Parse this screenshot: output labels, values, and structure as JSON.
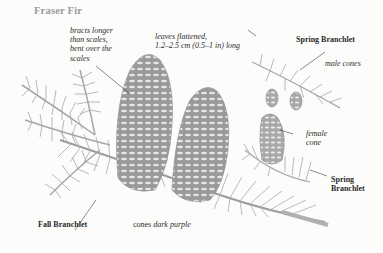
{
  "title": "Fraser Fir",
  "labels": {
    "bracts": [
      "bracts longer",
      "than scales,",
      "bent over the",
      "scales"
    ],
    "leaves": [
      "leaves flattened,",
      "1.2–2.5 cm (0.5–1 in) long"
    ],
    "spring_branchlet_top": "Spring Branchlet",
    "male_cones": "male cones",
    "female_cone": [
      "female",
      "cone"
    ],
    "spring_branchlet_bottom": [
      "Spring",
      "Branchlet"
    ],
    "fall_branchlet": "Fall Branchlet",
    "cones_color": {
      "prefix": "cones",
      "emph": "dark purple"
    }
  },
  "colors": {
    "background": "#fcfcfb",
    "title": "#9a9a9a",
    "text": "#2b2b2b",
    "illustration": "#9c9c9c"
  }
}
